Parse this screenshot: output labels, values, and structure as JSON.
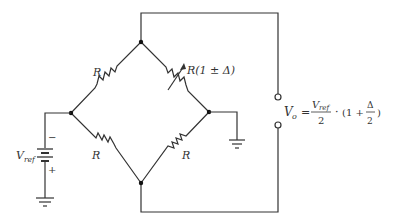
{
  "diagram": {
    "type": "wheatstone-bridge",
    "resistors": {
      "top_left": "R",
      "top_right": "R(1 ± Δ)",
      "bottom_left": "R",
      "bottom_right": "R"
    },
    "source": {
      "label_main": "V",
      "label_sub": "ref",
      "minus": "−",
      "plus": "+"
    },
    "output": {
      "lhs_main": "V",
      "lhs_sub": "o",
      "equals": "=",
      "num_main": "V",
      "num_sub": "ref",
      "den": "2",
      "dot": "·",
      "open": "(1 +",
      "delta": "Δ",
      "den2": "2",
      "close": ")"
    },
    "colors": {
      "ink": "#333333",
      "background": "#ffffff"
    }
  }
}
